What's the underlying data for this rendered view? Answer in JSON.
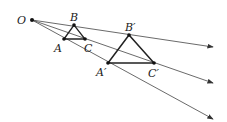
{
  "diagram": {
    "type": "homothety",
    "points": {
      "O": {
        "label": "O",
        "x": 32,
        "y": 20
      },
      "A": {
        "label": "A",
        "x": 64,
        "y": 39
      },
      "B": {
        "label": "B",
        "x": 74,
        "y": 25
      },
      "C": {
        "label": "C",
        "x": 85,
        "y": 39
      },
      "A_prime": {
        "label": "A′",
        "x": 108,
        "y": 63
      },
      "B_prime": {
        "label": "B′",
        "x": 129,
        "y": 35
      },
      "C_prime": {
        "label": "C′",
        "x": 154,
        "y": 63
      }
    },
    "rays": [
      {
        "from": "O",
        "through": "B",
        "end": [
          213,
          47
        ]
      },
      {
        "from": "O",
        "through": "C",
        "end": [
          213,
          83
        ]
      },
      {
        "from": "O",
        "through": "A",
        "end": [
          213,
          119
        ]
      }
    ],
    "colors": {
      "line": "#333333",
      "text": "#222222"
    }
  }
}
